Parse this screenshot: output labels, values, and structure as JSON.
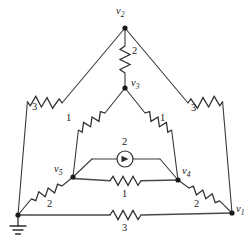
{
  "diagram": {
    "type": "electrical-circuit-schematic",
    "background_color": "#ffffff",
    "line_color": "#3a3a3a"
  },
  "nodes": [
    {
      "id": "v2",
      "label": "v",
      "subscript": "2",
      "x": 125,
      "y": 28,
      "label_x": 118,
      "label_y": 8
    },
    {
      "id": "v3",
      "label": "v",
      "subscript": "3",
      "x": 125,
      "y": 88,
      "label_x": 131,
      "label_y": 79
    },
    {
      "id": "v5",
      "label": "v",
      "subscript": "5",
      "x": 73,
      "y": 177,
      "label_x": 56,
      "label_y": 165
    },
    {
      "id": "v4",
      "label": "v",
      "subscript": "4",
      "x": 178,
      "y": 180,
      "label_x": 182,
      "label_y": 168
    },
    {
      "id": "v1",
      "label": "v",
      "subscript": "1",
      "x": 232,
      "y": 213,
      "label_x": 236,
      "label_y": 205
    },
    {
      "id": "gnd",
      "label": "",
      "subscript": "",
      "x": 18,
      "y": 215,
      "label_x": 0,
      "label_y": 0
    }
  ],
  "components": [
    {
      "id": "r-v2-v3",
      "kind": "resistor",
      "value": "2",
      "from": "v2",
      "to": "v3",
      "label_x": 132,
      "label_y": 48
    },
    {
      "id": "r-v2-gnd",
      "kind": "resistor",
      "value": "3",
      "from": "v2",
      "to": "gnd",
      "label_x": 35,
      "label_y": 106
    },
    {
      "id": "r-v2-v1",
      "kind": "resistor",
      "value": "3",
      "from": "v2",
      "to": "v1",
      "label_x": 192,
      "label_y": 107
    },
    {
      "id": "r-v3-v5",
      "kind": "resistor",
      "value": "1",
      "from": "v3",
      "to": "v5",
      "label_x": 83,
      "label_y": 125
    },
    {
      "id": "r-v3-v4",
      "kind": "resistor",
      "value": "1",
      "from": "v3",
      "to": "v4",
      "label_x": 159,
      "label_y": 125
    },
    {
      "id": "i-v5-v4",
      "kind": "current-source",
      "value": "2",
      "from": "v5",
      "to": "v4",
      "label_x": 122,
      "label_y": 139,
      "direction": "right"
    },
    {
      "id": "r-v5-v4",
      "kind": "resistor",
      "value": "1",
      "from": "v5",
      "to": "v4",
      "label_x": 122,
      "label_y": 187
    },
    {
      "id": "r-v5-gnd",
      "kind": "resistor",
      "value": "2",
      "from": "v5",
      "to": "gnd",
      "label_x": 51,
      "label_y": 203
    },
    {
      "id": "r-v4-v1",
      "kind": "resistor",
      "value": "2",
      "from": "v4",
      "to": "v1",
      "label_x": 196,
      "label_y": 203
    },
    {
      "id": "r-gnd-v1",
      "kind": "resistor",
      "value": "3",
      "from": "gnd",
      "to": "v1",
      "label_x": 122,
      "label_y": 222
    }
  ],
  "ground": {
    "name": "ground-symbol",
    "x": 18,
    "y": 215
  }
}
